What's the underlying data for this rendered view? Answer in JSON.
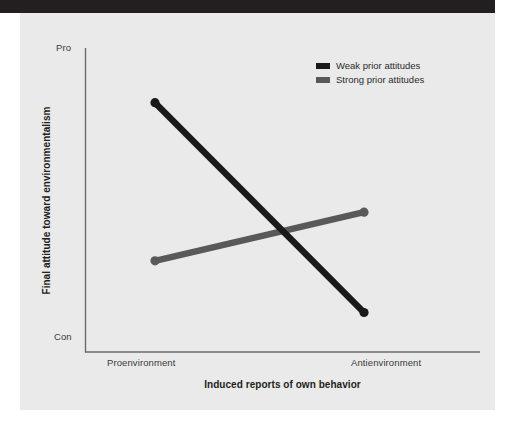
{
  "figure": {
    "background_color": "#eaeaea",
    "page_color": "#ffffff",
    "top_bar_color": "#231f20"
  },
  "chart_data": {
    "type": "line",
    "title": "",
    "subtitle": "",
    "xlabel": "Induced reports of own behavior",
    "ylabel": "Final attitude toward environmentalism",
    "categories": [
      "Proenvironment",
      "Antienvironment"
    ],
    "x": [
      0,
      1
    ],
    "xticklabels": [
      "Proenvironment",
      "Antienvironment"
    ],
    "yticklabels": [
      "Con",
      "Pro"
    ],
    "ylim": [
      0,
      1
    ],
    "ytick_low_label": "Con",
    "ytick_high_label": "Pro",
    "grid": false,
    "legend_position": "top-right",
    "series": [
      {
        "name": "Weak prior attitudes",
        "color": "#1a1a1a",
        "values": [
          0.82,
          0.13
        ],
        "markers": true
      },
      {
        "name": "Strong prior attitudes",
        "color": "#595959",
        "values": [
          0.3,
          0.46
        ],
        "markers": true
      }
    ],
    "annotations": []
  },
  "axes": {
    "y_title": "Final attitude toward environmentalism",
    "x_title": "Induced reports of own behavior",
    "y_top_tick": "Pro",
    "y_bottom_tick": "Con",
    "x_left_tick": "Proenvironment",
    "x_right_tick": "Antienvironment",
    "axis_line_color": "#6b6b6b"
  },
  "legend": {
    "items": [
      {
        "label": "Weak prior attitudes",
        "color": "#1a1a1a"
      },
      {
        "label": "Strong prior attitudes",
        "color": "#595959"
      }
    ]
  }
}
